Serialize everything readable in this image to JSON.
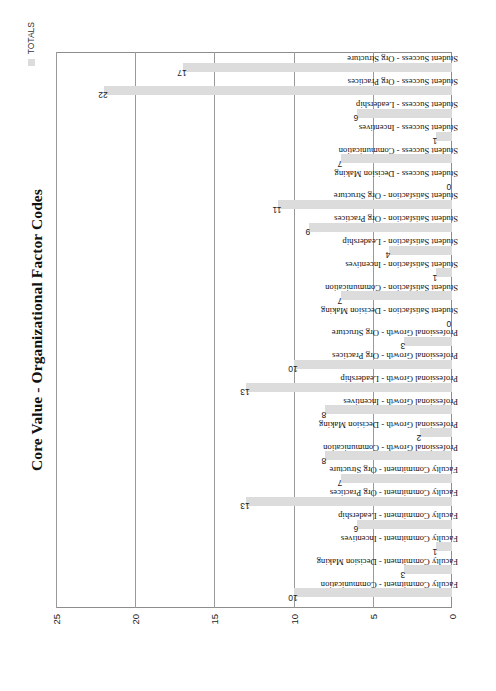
{
  "page": {
    "frame_color": "#7a7a7a",
    "background": "#ffffff"
  },
  "chart_title": "Core Value - Organizational Factor Codes",
  "legend": {
    "entries": [
      {
        "label": "TOTALS",
        "color": "#dcdcdc"
      }
    ],
    "position": "top-right"
  },
  "chart_data": {
    "type": "bar",
    "title": "Core Value - Organizational Factor Codes",
    "xlabel": "",
    "ylabel": "",
    "orientation": "vertical",
    "grid": true,
    "ylim": [
      0,
      25
    ],
    "yticks": [
      0,
      5,
      10,
      15,
      20,
      25
    ],
    "series_name": "TOTALS",
    "bar_color": "#dcdcdc",
    "categories": [
      "Faculty Commitment - Communication",
      "Faculty Commitment - Decision Making",
      "Faculty Commitment - Incentives",
      "Faculty Commitment - Leadership",
      "Faculty Commitment - Org Practices",
      "Faculty Commitment - Org Structure",
      "Professional Growth - Communication",
      "Professional Growth - Decision Making",
      "Professional Growth - Incentives",
      "Professional Growth - Leadership",
      "Professional Growth - Org Practices",
      "Professional Growth - Org Structure",
      "Student Satisfaction - Decision Making",
      "Student Satisfaction - Communication",
      "Student Satisfaction - Incentives",
      "Student Satisfaction - Leadership",
      "Student Satisfaction - Org Practices",
      "Student Satisfaction - Org Structure",
      "Student Success - Decision Making",
      "Student Success - Communication",
      "Student Success - Incentives",
      "Student Success - Leadership",
      "Student Success - Org Practices",
      "Student Success - Org Structure"
    ],
    "values": [
      10,
      3,
      1,
      6,
      13,
      7,
      8,
      2,
      8,
      13,
      10,
      3,
      0,
      7,
      1,
      4,
      9,
      11,
      0,
      7,
      1,
      6,
      22,
      17
    ],
    "data_labels": [
      "10",
      "3",
      "1",
      "6",
      "13",
      "7",
      "8",
      "2",
      "8",
      "13",
      "10",
      "3",
      "0",
      "7",
      "1",
      "4",
      "9",
      "11",
      "0",
      "7",
      "1",
      "6",
      "22",
      "17"
    ]
  }
}
